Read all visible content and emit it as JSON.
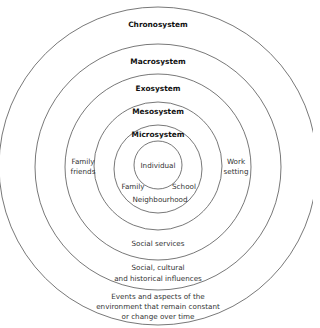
{
  "systems": [
    {
      "name": "Chronosystem",
      "description": "Events and aspects of the environment that remain constant or change over time"
    },
    {
      "name": "Macrosystem",
      "description": "Social, cultural and historical influences"
    },
    {
      "name": "Exosystem",
      "description": "Social services"
    },
    {
      "name": "Mesosystem",
      "examples": [
        "Family friends",
        "Work setting"
      ]
    },
    {
      "name": "Microsystem",
      "examples": [
        "Family",
        "School",
        "Neighbourhood"
      ]
    },
    {
      "name": "Individual"
    }
  ],
  "labels": {
    "chrono": "Chronosystem",
    "macro": "Macrosystem",
    "exo": "Exosystem",
    "meso": "Mesosystem",
    "micro": "Microsystem",
    "individual": "Individual",
    "family": "Family",
    "school": "School",
    "neighbourhood": "Neighbourhood",
    "family_friends_1": "Family",
    "family_friends_2": "friends",
    "work_setting_1": "Work",
    "work_setting_2": "setting",
    "social_services": "Social services",
    "social_cultural_1": "Social, cultural",
    "social_cultural_2": "and historical influences",
    "events_1": "Events and aspects of the",
    "events_2": "environment that remain constant",
    "events_3": "or change over time"
  },
  "colors": {
    "stroke": "#555555",
    "text": "#333333"
  }
}
